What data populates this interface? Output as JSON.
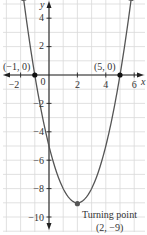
{
  "chart_data": {
    "type": "line",
    "title": "",
    "xlabel": "x",
    "ylabel": "y",
    "function": "y = x^2 - 4x - 5",
    "xlim": [
      -3.4,
      6.8
    ],
    "ylim": [
      -11,
      5
    ],
    "x_ticks": [
      -2,
      0,
      2,
      4,
      6
    ],
    "x_tick_labels": [
      "-2",
      "0",
      "2",
      "4",
      "6"
    ],
    "y_ticks": [
      -10,
      -8,
      -6,
      -4,
      -2,
      2,
      4
    ],
    "y_tick_labels": [
      "-10",
      "-8",
      "-6",
      "-4",
      "-2",
      "2",
      "4"
    ],
    "grid": true,
    "series": [
      {
        "name": "parabola",
        "x": [
          -1.9,
          -1,
          0,
          1,
          2,
          3,
          4,
          5,
          5.9
        ],
        "y": [
          5.2,
          0,
          -5,
          -8,
          -9,
          -8,
          -5,
          0,
          5.2
        ]
      }
    ],
    "points": [
      {
        "x": -1,
        "y": 0,
        "label": "(−1, 0)"
      },
      {
        "x": 5,
        "y": 0,
        "label": "(5, 0)"
      },
      {
        "x": 2,
        "y": -9,
        "label": "(2, −9)"
      }
    ],
    "annotations": [
      {
        "text": "Turning point",
        "x": 2,
        "y": -9
      }
    ]
  },
  "labels": {
    "x_axis": "x",
    "y_axis": "y",
    "origin": "0",
    "pt_left": "(−1, 0)",
    "pt_right": "(5, 0)",
    "turning_title": "Turning point",
    "turning_coords": "(2, −9)",
    "xt_m2": "−2",
    "xt_2": "2",
    "xt_4": "4",
    "xt_6": "6",
    "yt_4": "4",
    "yt_2": "2",
    "yt_m2": "−2",
    "yt_m4": "−4",
    "yt_m6": "−6",
    "yt_m8": "−8",
    "yt_m10": "−10"
  },
  "colors": {
    "grid": "#d9d9d9",
    "axis": "#222222",
    "curve": "#555555",
    "point": "#111111"
  }
}
